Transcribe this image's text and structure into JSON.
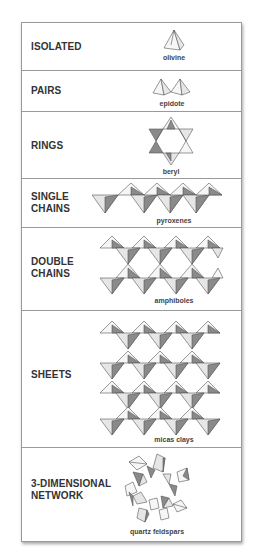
{
  "rows": [
    {
      "label": "ISOLATED",
      "example": "olivine"
    },
    {
      "label": "PAIRS",
      "example": "epidote"
    },
    {
      "label": "RINGS",
      "example": "beryl"
    },
    {
      "label_line1": "SINGLE",
      "label_line2": "CHAINS",
      "example": "pyroxenes"
    },
    {
      "label_line1": "DOUBLE",
      "label_line2": "CHAINS",
      "example": "amphiboles"
    },
    {
      "label": "SHEETS",
      "example": "micas clays"
    },
    {
      "label_line1": "3-DIMENSIONAL",
      "label_line2": "NETWORK",
      "example": "quartz feldspars"
    }
  ],
  "colors": {
    "border": "#9a9a9a",
    "dark_face": "#8a8a8a",
    "light_face": "#e6e6e6",
    "text": "#333333"
  }
}
